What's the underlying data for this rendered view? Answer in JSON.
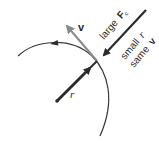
{
  "diagram": {
    "labels": {
      "velocity": "v",
      "radius": "r",
      "force_line1_word": "large",
      "force_line1_symbol": "F",
      "force_line1_sub": "c",
      "line2_word": "small",
      "line2_symbol": "r",
      "line3_word": "same",
      "line3_symbol": "v"
    },
    "colors": {
      "stroke_dark": "#2b2b2b",
      "velocity_arrow": "#8a8a8a",
      "circle": "#3a3a3a",
      "background": "#ffffff"
    }
  }
}
